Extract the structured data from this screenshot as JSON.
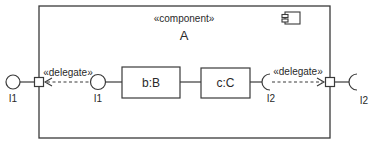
{
  "diagram": {
    "type": "uml-component",
    "component": {
      "stereotype": "«component»",
      "name": "A"
    },
    "parts": [
      {
        "id": "b",
        "label": "b:B"
      },
      {
        "id": "c",
        "label": "c:C"
      }
    ],
    "interfaces": {
      "outer_provided": {
        "label": "I1",
        "kind": "provided"
      },
      "inner_provided": {
        "label": "I1",
        "kind": "provided"
      },
      "inner_required": {
        "label": "I2",
        "kind": "required"
      },
      "outer_required": {
        "label": "I2",
        "kind": "required"
      }
    },
    "connectors": {
      "left_delegate": "«delegate»",
      "right_delegate": "«delegate»"
    },
    "colors": {
      "line": "#3a3a3a",
      "background": "#ffffff"
    }
  }
}
